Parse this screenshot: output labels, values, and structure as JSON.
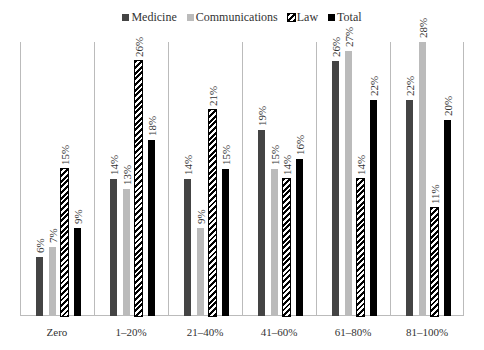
{
  "chart_data": {
    "type": "bar",
    "title": "",
    "xlabel": "",
    "ylabel": "",
    "ylim": [
      0,
      28
    ],
    "grid": false,
    "legend_position": "top",
    "categories": [
      "Zero",
      "1–20%",
      "21–40%",
      "41–60%",
      "61–80%",
      "81–100%"
    ],
    "series": [
      {
        "name": "Medicine",
        "color": "#444444",
        "pattern": "solid",
        "values": [
          6,
          14,
          14,
          19,
          26,
          22
        ],
        "labels": [
          "6%",
          "14%",
          "14%",
          "19%",
          "26%",
          "22%"
        ]
      },
      {
        "name": "Communications",
        "color": "#bbbbbb",
        "pattern": "solid",
        "values": [
          7,
          13,
          9,
          15,
          27,
          28
        ],
        "labels": [
          "7%",
          "13%",
          "9%",
          "15%",
          "27%",
          "28%"
        ]
      },
      {
        "name": "Law",
        "color": "#000000",
        "pattern": "diagonal-hatch",
        "values": [
          15,
          26,
          21,
          14,
          14,
          11
        ],
        "labels": [
          "15%",
          "26%",
          "21%",
          "14%",
          "14%",
          "11%"
        ]
      },
      {
        "name": "Total",
        "color": "#000000",
        "pattern": "solid",
        "values": [
          9,
          18,
          15,
          16,
          22,
          20
        ],
        "labels": [
          "9%",
          "18%",
          "15%",
          "16%",
          "22%",
          "20%"
        ]
      }
    ]
  },
  "legend": {
    "items": [
      {
        "label": "Medicine"
      },
      {
        "label": "Communications"
      },
      {
        "label": "Law"
      },
      {
        "label": "Total"
      }
    ]
  }
}
